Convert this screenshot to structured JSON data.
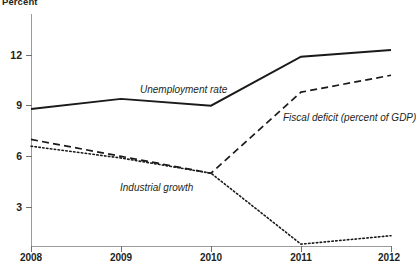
{
  "chart_data": {
    "type": "line",
    "title": "",
    "ylabel": "Percent",
    "xlabel": "",
    "x": [
      "2008",
      "2009",
      "2010",
      "2011",
      "2012"
    ],
    "categories": [
      "2008",
      "2009",
      "2010",
      "2011",
      "2012"
    ],
    "ylim": [
      0,
      13.6
    ],
    "xlim": [
      2008,
      2012
    ],
    "yticks": [
      "3",
      "6",
      "9",
      "12"
    ],
    "ytick_values": [
      3,
      6,
      9,
      12
    ],
    "grid": false,
    "legend": "inline-annotations",
    "series": [
      {
        "name": "Unemployment rate",
        "style": "solid",
        "values": [
          8.8,
          9.4,
          9.0,
          11.9,
          12.3
        ]
      },
      {
        "name": "Fiscal deficit (percent of GDP)",
        "style": "dashed",
        "values": [
          7.0,
          6.0,
          5.0,
          9.8,
          10.8
        ]
      },
      {
        "name": "Industrial growth",
        "style": "dotted",
        "values": [
          6.6,
          5.9,
          5.0,
          0.8,
          1.3
        ]
      }
    ],
    "annotations": [
      "Unemployment rate",
      "Fiscal deficit (percent of GDP)",
      "Industrial growth"
    ]
  },
  "axis": {
    "y_title": "Percent",
    "y_ticks": [
      "12",
      "9",
      "6",
      "3"
    ],
    "x_ticks": [
      "2008",
      "2009",
      "2010",
      "2011",
      "2012"
    ]
  },
  "colors": {
    "series_line": "#1a1a1a",
    "axis": "#9b9b9b",
    "tick": "#6f6f6f",
    "text": "#231f20",
    "background": "#ffffff"
  }
}
